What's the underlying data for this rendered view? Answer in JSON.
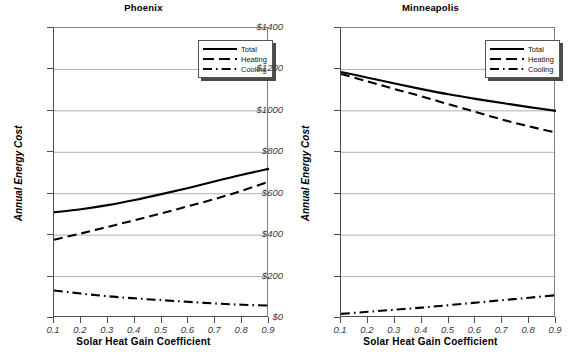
{
  "figure": {
    "width": 574,
    "height": 356,
    "background": "#ffffff",
    "line_color": "#000000",
    "grid_color": "#b0b0b0"
  },
  "axis": {
    "ylabel": "Annual Energy Cost",
    "xlabel": "Solar Heat Gain Coefficient",
    "ytick_labels": [
      "$1400",
      "$1200",
      "$1000",
      "$800",
      "$600",
      "$400",
      "$200",
      "$0"
    ],
    "xtick_labels": [
      "0.1",
      "0.2",
      "0.3",
      "0.4",
      "0.5",
      "0.6",
      "0.7",
      "0.8",
      "0.9"
    ],
    "ylim": [
      0,
      1400
    ],
    "xlim": [
      0.1,
      0.9
    ]
  },
  "legend": {
    "position": "top-right",
    "entries": [
      {
        "label": "Total",
        "style": "solid"
      },
      {
        "label": "Heating",
        "style": "dashed"
      },
      {
        "label": "Cooling",
        "style": "dash-dot"
      }
    ]
  },
  "panels": [
    {
      "title": "Phoenix"
    },
    {
      "title": "Minneapolis"
    }
  ],
  "chart_data": [
    {
      "type": "line",
      "title": "Phoenix",
      "xlabel": "Solar Heat Gain Coefficient",
      "ylabel": "Annual Energy Cost",
      "x": [
        0.1,
        0.2,
        0.3,
        0.4,
        0.5,
        0.6,
        0.7,
        0.8,
        0.9
      ],
      "xlim": [
        0.1,
        0.9
      ],
      "ylim": [
        0,
        1400
      ],
      "ytick_values": [
        0,
        200,
        400,
        600,
        800,
        1000,
        1200,
        1400
      ],
      "grid": "horizontal",
      "legend_position": "top-right",
      "series": [
        {
          "name": "Total",
          "style": "solid",
          "values": [
            510,
            525,
            545,
            570,
            598,
            628,
            660,
            692,
            720
          ]
        },
        {
          "name": "Heating",
          "style": "dashed",
          "values": [
            378,
            408,
            440,
            472,
            505,
            540,
            575,
            615,
            658
          ]
        },
        {
          "name": "Cooling",
          "style": "dash-dot",
          "values": [
            133,
            118,
            105,
            95,
            86,
            78,
            70,
            64,
            60
          ]
        }
      ]
    },
    {
      "type": "line",
      "title": "Minneapolis",
      "xlabel": "Solar Heat Gain Coefficient",
      "ylabel": "Annual Energy Cost",
      "x": [
        0.1,
        0.2,
        0.3,
        0.4,
        0.5,
        0.6,
        0.7,
        0.8,
        0.9
      ],
      "xlim": [
        0.1,
        0.9
      ],
      "ylim": [
        0,
        1400
      ],
      "ytick_values": [
        0,
        200,
        400,
        600,
        800,
        1000,
        1200,
        1400
      ],
      "grid": "horizontal",
      "legend_position": "top-right",
      "series": [
        {
          "name": "Total",
          "style": "solid",
          "values": [
            1188,
            1160,
            1132,
            1105,
            1080,
            1058,
            1038,
            1018,
            1000
          ]
        },
        {
          "name": "Heating",
          "style": "dashed",
          "values": [
            1178,
            1142,
            1105,
            1070,
            1032,
            995,
            958,
            925,
            895
          ]
        },
        {
          "name": "Cooling",
          "style": "dash-dot",
          "values": [
            20,
            30,
            40,
            50,
            62,
            74,
            86,
            98,
            110
          ]
        }
      ]
    }
  ]
}
